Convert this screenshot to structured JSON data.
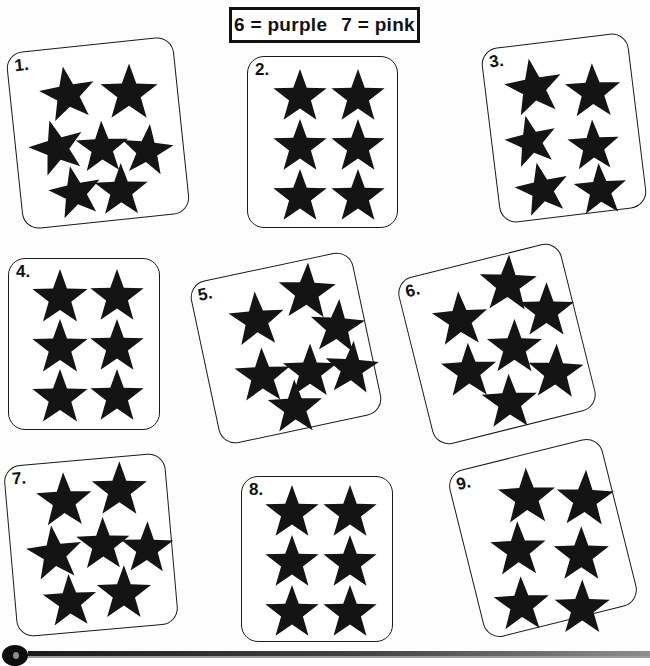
{
  "worksheet": {
    "title": "Star Counting Color-by-Number Worksheet",
    "background_color": "#fdfdfd",
    "star_color": "#141414",
    "box_border_color": "#1a1a1a"
  },
  "key": {
    "entries": [
      {
        "number": "6",
        "equals": "=",
        "color_name": "purple",
        "text": "6 = purple"
      },
      {
        "number": "7",
        "equals": "=",
        "color_name": "pink",
        "text": "7 = pink"
      }
    ]
  },
  "boxes": [
    {
      "label": "1.",
      "star_count": 7,
      "rotation": -6,
      "left": 14,
      "top": 44,
      "width": 168,
      "height": 178,
      "stars": [
        {
          "x": 28,
          "y": 18,
          "size": 58,
          "rot": -4
        },
        {
          "x": 88,
          "y": 22,
          "size": 60,
          "rot": 6
        },
        {
          "x": 12,
          "y": 70,
          "size": 58,
          "rot": -10
        },
        {
          "x": 58,
          "y": 76,
          "size": 55,
          "rot": 4
        },
        {
          "x": 103,
          "y": 84,
          "size": 54,
          "rot": 12
        },
        {
          "x": 27,
          "y": 118,
          "size": 55,
          "rot": -6
        },
        {
          "x": 72,
          "y": 120,
          "size": 56,
          "rot": 5
        }
      ]
    },
    {
      "label": "2.",
      "star_count": 6,
      "rotation": 0,
      "left": 247,
      "top": 56,
      "width": 151,
      "height": 172,
      "stars": [
        {
          "x": 24,
          "y": 12,
          "size": 56,
          "rot": 0
        },
        {
          "x": 82,
          "y": 12,
          "size": 56,
          "rot": 0
        },
        {
          "x": 24,
          "y": 62,
          "size": 56,
          "rot": 0
        },
        {
          "x": 82,
          "y": 62,
          "size": 56,
          "rot": 0
        },
        {
          "x": 24,
          "y": 112,
          "size": 56,
          "rot": 0
        },
        {
          "x": 82,
          "y": 112,
          "size": 56,
          "rot": 0
        }
      ]
    },
    {
      "label": "3.",
      "star_count": 6,
      "rotation": -7,
      "left": 490,
      "top": 40,
      "width": 148,
      "height": 176,
      "stars": [
        {
          "x": 18,
          "y": 14,
          "size": 60,
          "rot": -3
        },
        {
          "x": 77,
          "y": 26,
          "size": 58,
          "rot": 5
        },
        {
          "x": 12,
          "y": 70,
          "size": 54,
          "rot": -6
        },
        {
          "x": 73,
          "y": 82,
          "size": 54,
          "rot": 4
        },
        {
          "x": 16,
          "y": 118,
          "size": 56,
          "rot": -5
        },
        {
          "x": 74,
          "y": 126,
          "size": 55,
          "rot": 3
        }
      ]
    },
    {
      "label": "4.",
      "star_count": 6,
      "rotation": 0,
      "left": 8,
      "top": 258,
      "width": 152,
      "height": 172,
      "stars": [
        {
          "x": 22,
          "y": 10,
          "size": 58,
          "rot": 0
        },
        {
          "x": 80,
          "y": 10,
          "size": 56,
          "rot": 0
        },
        {
          "x": 22,
          "y": 60,
          "size": 58,
          "rot": 0
        },
        {
          "x": 80,
          "y": 60,
          "size": 56,
          "rot": 0
        },
        {
          "x": 22,
          "y": 110,
          "size": 58,
          "rot": 0
        },
        {
          "x": 80,
          "y": 110,
          "size": 56,
          "rot": 0
        }
      ]
    },
    {
      "label": "5.",
      "star_count": 7,
      "rotation": -12,
      "left": 203,
      "top": 265,
      "width": 166,
      "height": 166,
      "stars": [
        {
          "x": 30,
          "y": 20,
          "size": 58,
          "rot": 8
        },
        {
          "x": 84,
          "y": 2,
          "size": 60,
          "rot": 14
        },
        {
          "x": 108,
          "y": 44,
          "size": 57,
          "rot": 16
        },
        {
          "x": 24,
          "y": 76,
          "size": 58,
          "rot": 10
        },
        {
          "x": 72,
          "y": 82,
          "size": 57,
          "rot": 12
        },
        {
          "x": 114,
          "y": 88,
          "size": 56,
          "rot": 16
        },
        {
          "x": 50,
          "y": 114,
          "size": 57,
          "rot": 10
        }
      ]
    },
    {
      "label": "6.",
      "star_count": 7,
      "rotation": -14,
      "left": 413,
      "top": 258,
      "width": 168,
      "height": 172,
      "stars": [
        {
          "x": 24,
          "y": 24,
          "size": 58,
          "rot": 10
        },
        {
          "x": 78,
          "y": 0,
          "size": 60,
          "rot": 16
        },
        {
          "x": 110,
          "y": 36,
          "size": 58,
          "rot": 14
        },
        {
          "x": 20,
          "y": 76,
          "size": 58,
          "rot": 12
        },
        {
          "x": 70,
          "y": 64,
          "size": 58,
          "rot": 14
        },
        {
          "x": 104,
          "y": 98,
          "size": 58,
          "rot": 16
        },
        {
          "x": 52,
          "y": 116,
          "size": 58,
          "rot": 12
        }
      ]
    },
    {
      "label": "7.",
      "star_count": 7,
      "rotation": -5,
      "left": 10,
      "top": 459,
      "width": 162,
      "height": 172,
      "stars": [
        {
          "x": 28,
          "y": 10,
          "size": 58,
          "rot": 3
        },
        {
          "x": 84,
          "y": 4,
          "size": 58,
          "rot": 5
        },
        {
          "x": 14,
          "y": 62,
          "size": 58,
          "rot": -2
        },
        {
          "x": 64,
          "y": 58,
          "size": 56,
          "rot": 4
        },
        {
          "x": 108,
          "y": 66,
          "size": 55,
          "rot": 6
        },
        {
          "x": 26,
          "y": 112,
          "size": 56,
          "rot": 2
        },
        {
          "x": 80,
          "y": 108,
          "size": 57,
          "rot": 5
        }
      ]
    },
    {
      "label": "8.",
      "star_count": 6,
      "rotation": 0,
      "left": 241,
      "top": 476,
      "width": 152,
      "height": 166,
      "stars": [
        {
          "x": 22,
          "y": 8,
          "size": 56,
          "rot": 0
        },
        {
          "x": 80,
          "y": 8,
          "size": 56,
          "rot": 0
        },
        {
          "x": 22,
          "y": 58,
          "size": 56,
          "rot": 0
        },
        {
          "x": 80,
          "y": 58,
          "size": 56,
          "rot": 0
        },
        {
          "x": 22,
          "y": 108,
          "size": 56,
          "rot": 0
        },
        {
          "x": 80,
          "y": 108,
          "size": 56,
          "rot": 0
        }
      ]
    },
    {
      "label": "9.",
      "star_count": 6,
      "rotation": -14,
      "left": 464,
      "top": 452,
      "width": 158,
      "height": 172,
      "stars": [
        {
          "x": 42,
          "y": 12,
          "size": 60,
          "rot": 12
        },
        {
          "x": 98,
          "y": 28,
          "size": 60,
          "rot": 16
        },
        {
          "x": 22,
          "y": 62,
          "size": 58,
          "rot": 12
        },
        {
          "x": 82,
          "y": 82,
          "size": 58,
          "rot": 14
        },
        {
          "x": 12,
          "y": 116,
          "size": 58,
          "rot": 12
        },
        {
          "x": 70,
          "y": 134,
          "size": 58,
          "rot": 14
        }
      ]
    }
  ],
  "footer": {
    "decoration": "horizontal-rule-with-dot"
  }
}
